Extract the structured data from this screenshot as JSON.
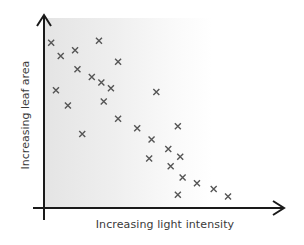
{
  "chart_data": {
    "type": "scatter",
    "title": "",
    "xlabel": "Increasing light intensity",
    "ylabel": "Increasing leaf area",
    "xlim": [
      0,
      100
    ],
    "ylim": [
      0,
      100
    ],
    "grid": false,
    "legend": null,
    "axis_ticks": "none (qualitative axes with arrowheads)",
    "marker": "x",
    "marker_color": "#555555",
    "background": "horizontal gradient, light grey near y-axis fading to white",
    "series": [
      {
        "name": "observations",
        "points": [
          {
            "x": 3,
            "y": 87
          },
          {
            "x": 7,
            "y": 80
          },
          {
            "x": 13,
            "y": 83
          },
          {
            "x": 23,
            "y": 88
          },
          {
            "x": 31,
            "y": 77
          },
          {
            "x": 14,
            "y": 73
          },
          {
            "x": 20,
            "y": 69
          },
          {
            "x": 24,
            "y": 66
          },
          {
            "x": 28,
            "y": 63
          },
          {
            "x": 5,
            "y": 62
          },
          {
            "x": 10,
            "y": 54
          },
          {
            "x": 25,
            "y": 56
          },
          {
            "x": 47,
            "y": 61
          },
          {
            "x": 16,
            "y": 39
          },
          {
            "x": 31,
            "y": 47
          },
          {
            "x": 39,
            "y": 42
          },
          {
            "x": 56,
            "y": 43
          },
          {
            "x": 45,
            "y": 36
          },
          {
            "x": 52,
            "y": 31
          },
          {
            "x": 44,
            "y": 26
          },
          {
            "x": 57,
            "y": 27
          },
          {
            "x": 53,
            "y": 22
          },
          {
            "x": 58,
            "y": 16
          },
          {
            "x": 64,
            "y": 13
          },
          {
            "x": 71,
            "y": 10
          },
          {
            "x": 77,
            "y": 6
          },
          {
            "x": 56,
            "y": 7
          }
        ]
      }
    ]
  },
  "colors": {
    "axis": "#1a1a1a",
    "marker": "#555555",
    "label": "#3a3a3a"
  },
  "plot_px": {
    "x0": 44,
    "x1": 283,
    "y0": 208,
    "y1": 18
  }
}
